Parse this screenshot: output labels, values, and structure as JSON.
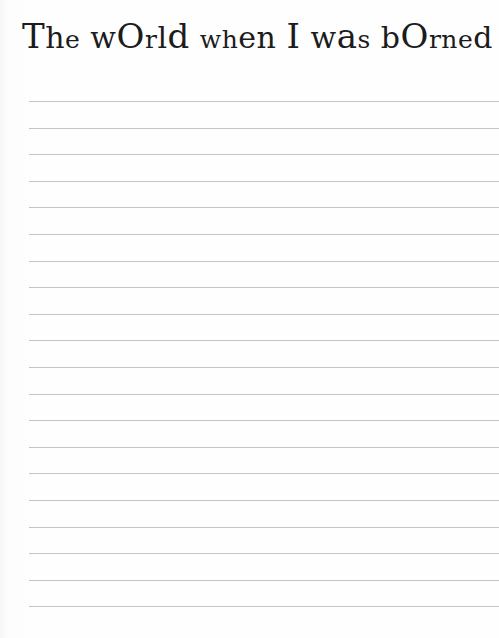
{
  "worksheet": {
    "title_full": "The world when I was borned",
    "title_glyphs": [
      {
        "t": "T",
        "s": "t-big"
      },
      {
        "t": "h",
        "s": "t-med"
      },
      {
        "t": "e",
        "s": "t-sm"
      },
      {
        "t": " ",
        "s": "t-med"
      },
      {
        "t": "w",
        "s": "t-med"
      },
      {
        "t": "O",
        "s": "t-big"
      },
      {
        "t": "r",
        "s": "t-sm"
      },
      {
        "t": "l",
        "s": "t-med"
      },
      {
        "t": "d",
        "s": "t-big"
      },
      {
        "t": " ",
        "s": "t-med"
      },
      {
        "t": "w",
        "s": "t-sm"
      },
      {
        "t": "h",
        "s": "t-sm"
      },
      {
        "t": "e",
        "s": "t-med"
      },
      {
        "t": "n",
        "s": "t-med"
      },
      {
        "t": " ",
        "s": "t-med"
      },
      {
        "t": "I",
        "s": "t-big"
      },
      {
        "t": " ",
        "s": "t-med"
      },
      {
        "t": "w",
        "s": "t-med"
      },
      {
        "t": "a",
        "s": "t-big"
      },
      {
        "t": "s",
        "s": "t-sm"
      },
      {
        "t": " ",
        "s": "t-med"
      },
      {
        "t": "b",
        "s": "t-med"
      },
      {
        "t": "O",
        "s": "t-big"
      },
      {
        "t": "r",
        "s": "t-sm"
      },
      {
        "t": "n",
        "s": "t-sm"
      },
      {
        "t": "e",
        "s": "t-sm"
      },
      {
        "t": "d",
        "s": "t-med"
      }
    ],
    "line_count": 20,
    "line_color": "#c4c4c4"
  }
}
